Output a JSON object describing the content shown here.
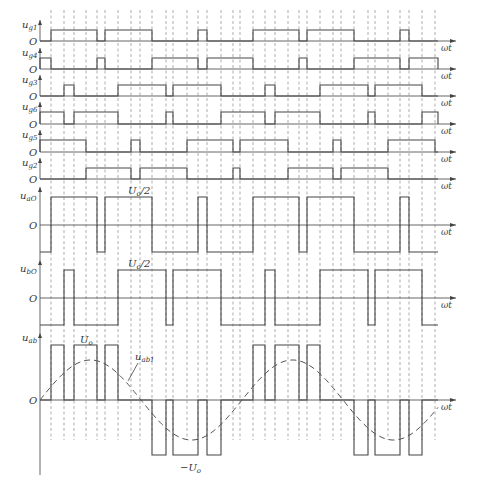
{
  "figure": {
    "x_start": 40,
    "x_end": 438,
    "axis_end": 456,
    "axis_label": "ωt",
    "dashed_lines_x": [
      51,
      64,
      74,
      86,
      97,
      105,
      118,
      131,
      140,
      152,
      166,
      173,
      187,
      198,
      207,
      221,
      233,
      240,
      253,
      265,
      275,
      288,
      299,
      307,
      320,
      333,
      341,
      354,
      368,
      375,
      388,
      400,
      409,
      422,
      435
    ],
    "dashed_top": 10,
    "dashed_bottom": 440
  },
  "gate_signals": [
    {
      "name": "u",
      "sub": "g1",
      "baseline": 41,
      "high": 30,
      "pulses": [
        [
          51,
          97
        ],
        [
          105,
          152
        ],
        [
          198,
          207
        ],
        [
          253,
          299
        ],
        [
          307,
          354
        ],
        [
          400,
          409
        ]
      ]
    },
    {
      "name": "u",
      "sub": "g4",
      "baseline": 69,
      "high": 58,
      "pulses": [
        [
          40,
          51
        ],
        [
          97,
          105
        ],
        [
          152,
          198
        ],
        [
          207,
          253
        ],
        [
          299,
          307
        ],
        [
          354,
          400
        ],
        [
          409,
          438
        ]
      ]
    },
    {
      "name": "u",
      "sub": "g3",
      "baseline": 96,
      "high": 85,
      "pulses": [
        [
          64,
          74
        ],
        [
          118,
          166
        ],
        [
          173,
          221
        ],
        [
          265,
          275
        ],
        [
          320,
          368
        ],
        [
          375,
          422
        ]
      ]
    },
    {
      "name": "u",
      "sub": "g6",
      "baseline": 124,
      "high": 112,
      "pulses": [
        [
          40,
          64
        ],
        [
          74,
          118
        ],
        [
          166,
          173
        ],
        [
          221,
          265
        ],
        [
          275,
          320
        ],
        [
          368,
          375
        ],
        [
          422,
          438
        ]
      ]
    },
    {
      "name": "u",
      "sub": "g5",
      "baseline": 152,
      "high": 140,
      "pulses": [
        [
          40,
          86
        ],
        [
          131,
          140
        ],
        [
          187,
          233
        ],
        [
          240,
          288
        ],
        [
          333,
          341
        ],
        [
          388,
          435
        ]
      ]
    },
    {
      "name": "u",
      "sub": "g2",
      "baseline": 179,
      "high": 168,
      "pulses": [
        [
          86,
          131
        ],
        [
          140,
          187
        ],
        [
          233,
          240
        ],
        [
          288,
          333
        ],
        [
          341,
          388
        ]
      ]
    }
  ],
  "phase_voltages": [
    {
      "name": "u",
      "sub": "aO",
      "zero": 225,
      "high": 197,
      "low": 252,
      "level_label": "U",
      "level_sub": "o",
      "level_suffix": "/2",
      "high_intervals": [
        [
          51,
          97
        ],
        [
          105,
          152
        ],
        [
          198,
          207
        ],
        [
          253,
          299
        ],
        [
          307,
          354
        ],
        [
          400,
          409
        ]
      ],
      "end": 438
    },
    {
      "name": "u",
      "sub": "bO",
      "zero": 298,
      "high": 270,
      "low": 325,
      "level_label": "U",
      "level_sub": "o",
      "level_suffix": "/2",
      "high_intervals": [
        [
          64,
          74
        ],
        [
          118,
          166
        ],
        [
          173,
          221
        ],
        [
          265,
          275
        ],
        [
          320,
          368
        ],
        [
          375,
          422
        ]
      ],
      "end": 438
    }
  ],
  "line_voltage": {
    "name": "u",
    "sub": "ab",
    "zero": 400,
    "pos": 345,
    "neg": 455,
    "pos_label": "U",
    "pos_sub": "o",
    "neg_label": "−U",
    "neg_sub": "o",
    "fundamental_label": "u",
    "fundamental_sub": "ab1",
    "pos_pulses": [
      [
        51,
        64
      ],
      [
        74,
        97
      ],
      [
        105,
        118
      ],
      [
        253,
        265
      ],
      [
        275,
        299
      ],
      [
        307,
        320
      ]
    ],
    "neg_pulses": [
      [
        152,
        166
      ],
      [
        173,
        198
      ],
      [
        207,
        221
      ],
      [
        354,
        368
      ],
      [
        375,
        400
      ],
      [
        409,
        422
      ]
    ],
    "sine_amplitude": 40,
    "sine_period": 202,
    "sine_start": 40,
    "end": 438
  },
  "labels": {
    "origin": "O"
  }
}
